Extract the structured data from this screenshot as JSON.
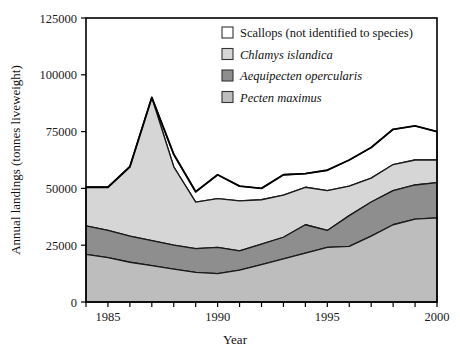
{
  "chart_data": {
    "type": "area",
    "stacked": true,
    "title": "",
    "xlabel": "Year",
    "ylabel": "Annual landings (tonnes liveweight)",
    "xlim": [
      1984,
      2000
    ],
    "ylim": [
      0,
      125000
    ],
    "ytick_labels": [
      "0",
      "25000",
      "50000",
      "75000",
      "100000",
      "125000"
    ],
    "ytick_values": [
      0,
      25000,
      50000,
      75000,
      100000,
      125000
    ],
    "xtick_labels": [
      "1985",
      "1990",
      "1995",
      "2000"
    ],
    "xtick_values": [
      1985,
      1990,
      1995,
      2000
    ],
    "xtick_minor_values": [
      1984,
      1986,
      1987,
      1988,
      1989,
      1991,
      1992,
      1993,
      1994,
      1996,
      1997,
      1998,
      1999
    ],
    "grid": false,
    "legend_position": "top-right",
    "x": [
      1984,
      1985,
      1986,
      1987,
      1988,
      1989,
      1990,
      1991,
      1992,
      1993,
      1994,
      1995,
      1996,
      1997,
      1998,
      1999,
      2000
    ],
    "series": [
      {
        "name": "Pecten maximus",
        "order": 1,
        "color": "#bdbdbd",
        "values": [
          21000,
          19500,
          17500,
          16000,
          14500,
          13000,
          12500,
          14000,
          16500,
          19000,
          21500,
          24000,
          24500,
          29000,
          34000,
          36500,
          37000
        ]
      },
      {
        "name": "Aequipecten opercularis",
        "order": 2,
        "color": "#8e8e8e",
        "values": [
          12500,
          12000,
          11500,
          11000,
          10500,
          10500,
          11500,
          8500,
          9000,
          9500,
          12500,
          7500,
          13500,
          15000,
          15000,
          15000,
          15500
        ]
      },
      {
        "name": "Chlamys islandica",
        "order": 3,
        "color": "#d6d6d6",
        "values": [
          17000,
          19000,
          30500,
          63000,
          34500,
          20500,
          21500,
          22000,
          19500,
          18500,
          16500,
          17500,
          13000,
          10500,
          11500,
          11000,
          10000
        ]
      },
      {
        "name": "Scallops (not identified to species)",
        "order": 4,
        "color": "#ffffff",
        "values": [
          0,
          0,
          0,
          0,
          5500,
          4500,
          10500,
          6500,
          5000,
          9000,
          6000,
          9000,
          11500,
          13500,
          15500,
          15000,
          12500
        ]
      }
    ],
    "totals": [
      50500,
      50500,
      59500,
      90000,
      65000,
      48500,
      56000,
      51000,
      50000,
      56000,
      56500,
      58000,
      62500,
      68000,
      76000,
      77500,
      75000
    ],
    "peak": {
      "year": 1987,
      "value": 90000
    }
  },
  "legend": {
    "items": [
      {
        "label": "Scallops (not identified to species)",
        "color": "#ffffff",
        "italic": false
      },
      {
        "label": "Chlamys islandica",
        "color": "#d6d6d6",
        "italic": true
      },
      {
        "label": "Aequipecten opercularis",
        "color": "#8e8e8e",
        "italic": true
      },
      {
        "label": "Pecten maximus",
        "color": "#bdbdbd",
        "italic": true
      }
    ]
  }
}
